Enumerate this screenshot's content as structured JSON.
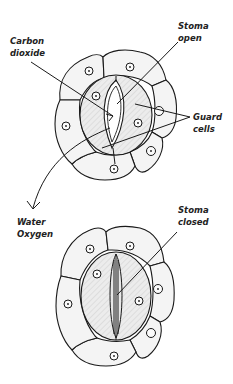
{
  "diagram": {
    "labels": {
      "carbon_dioxide": [
        "Carbon",
        "dioxide"
      ],
      "stoma_open": [
        "Stoma",
        "open"
      ],
      "guard_cells": [
        "Guard",
        "cells"
      ],
      "water_oxygen": [
        "Water",
        "Oxygen"
      ],
      "stoma_closed": [
        "Stoma",
        "closed"
      ]
    },
    "colors": {
      "stroke": "#1a1a1a",
      "cell_fill": "#f4f4f4",
      "guard_fill": "#e6e6e6",
      "text": "#222222"
    },
    "figures": [
      {
        "name": "open-stoma",
        "center": [
          110,
          108
        ]
      },
      {
        "name": "closed-stoma",
        "center": [
          115,
          305
        ]
      }
    ]
  }
}
